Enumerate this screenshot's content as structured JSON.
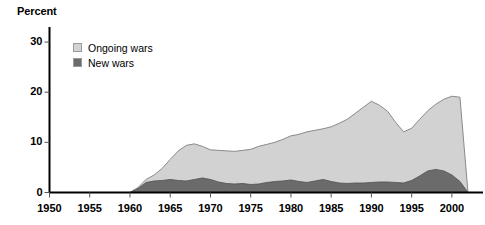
{
  "chart_data": {
    "type": "area",
    "title": "Percent",
    "xlabel": "",
    "ylabel": "Percent",
    "stacked": true,
    "grid": false,
    "legend_position": "top-left-inside",
    "xlim": [
      1950,
      2002
    ],
    "ylim": [
      0,
      33
    ],
    "xticks": [
      1950,
      1955,
      1960,
      1965,
      1970,
      1975,
      1980,
      1985,
      1990,
      1995,
      2000
    ],
    "yticks": [
      0,
      10,
      20,
      30
    ],
    "colors": {
      "ongoing_wars": "#d2d2d2",
      "new_wars": "#6b6b6b",
      "outline": "#8a8a8a",
      "axis": "#000000",
      "background": "#ffffff"
    },
    "series": [
      {
        "name": "Ongoing wars",
        "color": "#d2d2d2",
        "note": "total height of stack (ongoing + new), percent"
      },
      {
        "name": "New wars",
        "color": "#6b6b6b",
        "note": "lower band, percent"
      }
    ],
    "x": [
      1950,
      1951,
      1952,
      1953,
      1954,
      1955,
      1956,
      1957,
      1958,
      1959,
      1960,
      1961,
      1962,
      1963,
      1964,
      1965,
      1966,
      1967,
      1968,
      1969,
      1970,
      1971,
      1972,
      1973,
      1974,
      1975,
      1976,
      1977,
      1978,
      1979,
      1980,
      1981,
      1982,
      1983,
      1984,
      1985,
      1986,
      1987,
      1988,
      1989,
      1990,
      1991,
      1992,
      1993,
      1994,
      1995,
      1996,
      1997,
      1998,
      1999,
      2000,
      2001,
      2002
    ],
    "total_values": [
      0,
      0,
      0,
      0,
      0,
      0,
      0,
      0,
      0,
      0,
      0,
      1.0,
      2.6,
      3.5,
      4.8,
      6.6,
      8.3,
      9.4,
      9.7,
      9.2,
      8.5,
      8.4,
      8.3,
      8.2,
      8.4,
      8.6,
      9.2,
      9.6,
      10.0,
      10.6,
      11.3,
      11.6,
      12.1,
      12.4,
      12.7,
      13.1,
      13.8,
      14.6,
      15.8,
      17.0,
      18.2,
      17.4,
      16.2,
      14.0,
      12.1,
      12.8,
      14.6,
      16.3,
      17.6,
      18.6,
      19.2,
      19.0,
      0
    ],
    "new_wars_values": [
      0,
      0,
      0,
      0,
      0,
      0,
      0,
      0,
      0,
      0,
      0,
      0.8,
      2.0,
      2.3,
      2.4,
      2.6,
      2.4,
      2.3,
      2.6,
      2.9,
      2.6,
      2.1,
      1.8,
      1.7,
      1.8,
      1.6,
      1.7,
      2.0,
      2.2,
      2.3,
      2.5,
      2.2,
      2.0,
      2.3,
      2.6,
      2.2,
      1.9,
      1.8,
      1.9,
      1.9,
      2.0,
      2.1,
      2.1,
      2.0,
      1.9,
      2.4,
      3.3,
      4.3,
      4.6,
      4.3,
      3.5,
      2.2,
      0
    ]
  },
  "legend": {
    "items": [
      {
        "label": "Ongoing wars",
        "color": "#d2d2d2"
      },
      {
        "label": "New wars",
        "color": "#6b6b6b"
      }
    ]
  },
  "axis": {
    "y_title": "Percent",
    "y_tick_labels": [
      "30",
      "20",
      "10",
      "0"
    ],
    "x_tick_labels": [
      "1950",
      "1955",
      "1960",
      "1965",
      "1970",
      "1975",
      "1980",
      "1985",
      "1990",
      "1995",
      "2000"
    ]
  }
}
